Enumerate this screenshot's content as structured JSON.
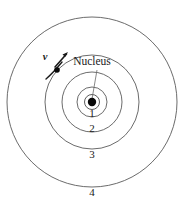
{
  "figure": {
    "name": "bohr-atom-model",
    "background_color": "#ffffff",
    "width": 185,
    "height": 208
  },
  "center": {
    "x": 92,
    "y": 102
  },
  "nucleus": {
    "label": "Nucleus",
    "label_x": 92,
    "label_y": 62,
    "dot_radius": 4.2,
    "ring_radius": 7.5,
    "color": "#0a0a0a",
    "leader": {
      "x1": 97,
      "y1": 70,
      "x2": 92,
      "y2": 99
    }
  },
  "electron": {
    "x": 57,
    "y": 70,
    "radius": 2.8,
    "color": "#0a0a0a",
    "shell": 2
  },
  "velocity": {
    "label": "v",
    "label_x": 45,
    "label_y": 58,
    "arrow_start_x": 46,
    "arrow_start_y": 78,
    "arrow_end_x": 68,
    "arrow_end_y": 52,
    "color": "#1a1a1a"
  },
  "shells": [
    {
      "label": "1",
      "radius": 15,
      "label_x": 92,
      "label_y": 114,
      "stroke": "#5a5a5a"
    },
    {
      "label": "2",
      "radius": 30,
      "label_x": 92,
      "label_y": 129,
      "stroke": "#5a5a5a"
    },
    {
      "label": "3",
      "radius": 47,
      "label_x": 92,
      "label_y": 155,
      "stroke": "#5a5a5a"
    },
    {
      "label": "4",
      "radius": 85,
      "label_x": 92,
      "label_y": 193,
      "stroke": "#5a5a5a"
    }
  ],
  "chart_data": {
    "type": "diagram",
    "elements": {
      "shell_labels": [
        "1",
        "2",
        "3",
        "4"
      ],
      "shell_radii_px": [
        15,
        30,
        47,
        85
      ],
      "nucleus_label": "Nucleus",
      "velocity_label": "v",
      "electron_on_shell": 2
    }
  }
}
